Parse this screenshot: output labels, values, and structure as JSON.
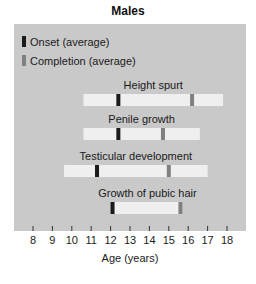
{
  "chart_data": {
    "type": "range-bar",
    "title": "Males",
    "xlabel": "Age (years)",
    "xlim": [
      8,
      18
    ],
    "xticks": [
      8,
      9,
      10,
      11,
      12,
      13,
      14,
      15,
      16,
      17,
      18
    ],
    "legend": {
      "placement": "top-left",
      "items": [
        {
          "label": "Onset (average)",
          "color": "#1a1a1a"
        },
        {
          "label": "Completion (average)",
          "color": "#808080"
        }
      ]
    },
    "series": [
      {
        "name": "Height spurt",
        "range": [
          10.6,
          17.8
        ],
        "onset": 12.4,
        "completion": 16.2
      },
      {
        "name": "Penile growth",
        "range": [
          10.6,
          16.6
        ],
        "onset": 12.4,
        "completion": 14.7
      },
      {
        "name": "Testicular development",
        "range": [
          9.6,
          17.0
        ],
        "onset": 11.3,
        "completion": 15.0
      },
      {
        "name": "Growth of pubic hair",
        "range": [
          12.1,
          15.7
        ],
        "onset": 12.1,
        "completion": 15.6
      }
    ],
    "colors": {
      "panel": "#c9c9c9",
      "bar": "#efefef",
      "onset": "#1a1a1a",
      "completion": "#808080"
    }
  }
}
